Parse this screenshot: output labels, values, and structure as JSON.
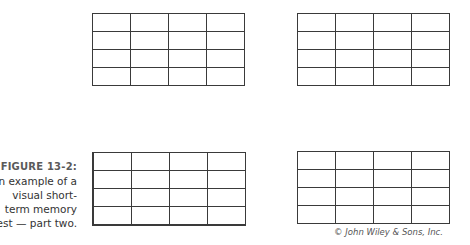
{
  "figure": {
    "label": "FIGURE 13-2:",
    "caption_lines": [
      "An example of a",
      "visual short-",
      "term memory",
      "test — part two."
    ],
    "caption_full": "An example of a visual short-term memory test — part two."
  },
  "grids": [
    {
      "position": "top-left",
      "rows": 4,
      "cols": 4,
      "filled_cells": []
    },
    {
      "position": "top-right",
      "rows": 4,
      "cols": 4,
      "filled_cells": []
    },
    {
      "position": "bottom-left",
      "rows": 4,
      "cols": 4,
      "filled_cells": []
    },
    {
      "position": "bottom-right",
      "rows": 4,
      "cols": 4,
      "filled_cells": []
    }
  ],
  "copyright": "© John Wiley & Sons, Inc.",
  "colors": {
    "grid_line": "#3a3a3a",
    "caption_label": "#5a5a5a",
    "caption_text": "#333333"
  }
}
